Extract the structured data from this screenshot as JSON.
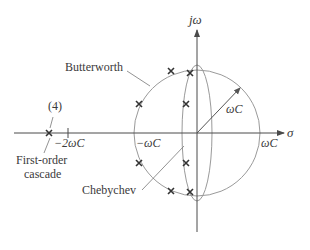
{
  "diagram": {
    "axes": {
      "vertical_label": "jω",
      "horizontal_label": "σ"
    },
    "radius_label": "ωC",
    "tick_labels": {
      "neg_wc": "−ωC",
      "neg_2wc": "−2ωC",
      "pos_wc": "ωC"
    },
    "annotations": {
      "butterworth": "Butterworth",
      "chebychev": "Chebychev",
      "cascade_line1": "First-order",
      "cascade_line2": "cascade",
      "multiplicity": "(4)"
    },
    "colors": {
      "axis": "#4a4a4a",
      "curve": "#9a9a9a",
      "pole": "#333333",
      "text": "#3a3a3a"
    }
  }
}
